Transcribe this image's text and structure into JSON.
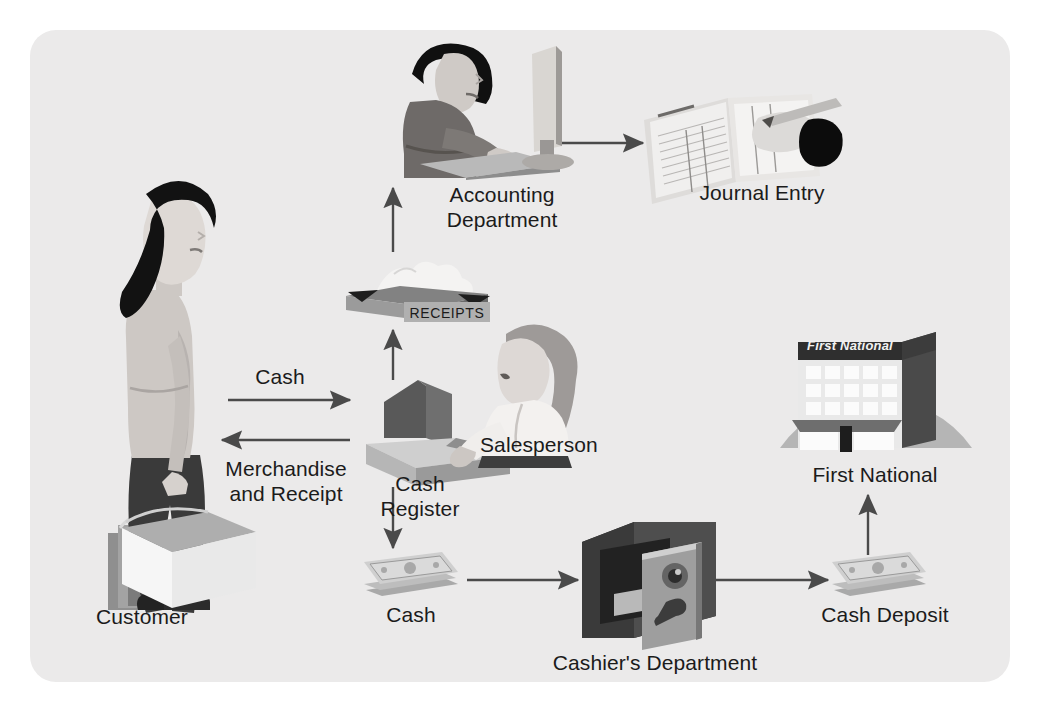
{
  "diagram": {
    "panel": {
      "background_color": "#ebeaea",
      "border_radius_px": 26
    },
    "palette": {
      "ink": "#1b1b1b",
      "arrow": "#4a4a4a",
      "dark_gray": "#5d5d5d",
      "mid_gray": "#8d8d8d",
      "light_gray": "#b9b9b9",
      "pale_gray": "#d8d8d8",
      "near_white": "#f2f1f0",
      "black": "#111111"
    },
    "nodes": [
      {
        "id": "customer",
        "label": "Customer",
        "icon": "woman-with-shopping-bags-icon"
      },
      {
        "id": "cash-register",
        "label": "Cash\nRegister",
        "icon": "cash-register-icon"
      },
      {
        "id": "salesperson",
        "label": "Salesperson",
        "icon": "salesperson-icon"
      },
      {
        "id": "receipts-box",
        "label": "RECEIPTS",
        "icon": "receipts-box-icon"
      },
      {
        "id": "accounting",
        "label": "Accounting\nDepartment",
        "icon": "accountant-at-computer-icon"
      },
      {
        "id": "journal-entry",
        "label": "Journal Entry",
        "icon": "journal-book-with-pen-icon"
      },
      {
        "id": "cash",
        "label": "Cash",
        "icon": "cash-stack-icon"
      },
      {
        "id": "cashiers-department",
        "label": "Cashier's Department",
        "icon": "safe-icon"
      },
      {
        "id": "cash-deposit",
        "label": "Cash Deposit",
        "icon": "cash-stack-icon"
      },
      {
        "id": "first-national",
        "label": "First National",
        "icon": "bank-building-icon"
      }
    ],
    "bank_sign": "First National",
    "edges": [
      {
        "id": "customer-to-register",
        "label": "Cash",
        "from": "customer",
        "to": "cash-register",
        "direction": "right"
      },
      {
        "id": "register-to-customer",
        "label": "Merchandise\nand Receipt",
        "from": "cash-register",
        "to": "customer",
        "direction": "left"
      },
      {
        "id": "register-to-receipts",
        "label": "",
        "from": "cash-register",
        "to": "receipts-box",
        "direction": "up"
      },
      {
        "id": "receipts-to-accounting",
        "label": "",
        "from": "receipts-box",
        "to": "accounting",
        "direction": "up"
      },
      {
        "id": "accounting-to-journal",
        "label": "",
        "from": "accounting",
        "to": "journal-entry",
        "direction": "right"
      },
      {
        "id": "register-to-cash",
        "label": "",
        "from": "cash-register",
        "to": "cash",
        "direction": "down"
      },
      {
        "id": "cash-to-cashiers",
        "label": "",
        "from": "cash",
        "to": "cashiers-department",
        "direction": "right"
      },
      {
        "id": "cashiers-to-deposit",
        "label": "",
        "from": "cashiers-department",
        "to": "cash-deposit",
        "direction": "right"
      },
      {
        "id": "deposit-to-bank",
        "label": "",
        "from": "cash-deposit",
        "to": "first-national",
        "direction": "up"
      }
    ]
  }
}
